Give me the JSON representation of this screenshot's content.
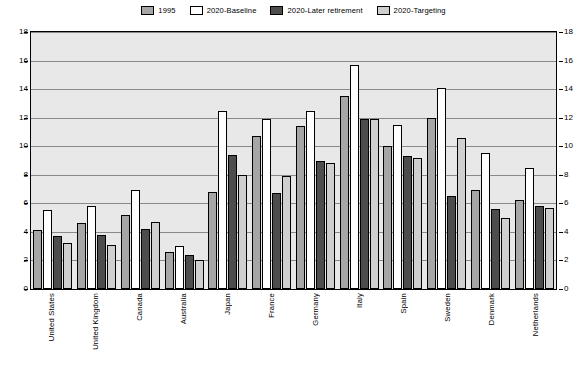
{
  "chart_data": {
    "type": "bar",
    "title": "",
    "subtitle": "",
    "xlabel": "",
    "ylabel": "",
    "ylim": [
      0,
      18
    ],
    "ytick_step": 2,
    "yticks": [
      "0",
      "2",
      "4",
      "6",
      "8",
      "10",
      "12",
      "14",
      "16",
      "18"
    ],
    "grid": true,
    "dual_y_axis": true,
    "legend_position": "top-center",
    "categories": [
      "United States",
      "United Kingdom",
      "Canada",
      "Australia",
      "Japan",
      "France",
      "Germany",
      "Italy",
      "Spain",
      "Sweden",
      "Denmark",
      "Netherlands"
    ],
    "series": [
      {
        "name": "1995",
        "color": "#a6a6a6",
        "values": [
          4.1,
          4.6,
          5.2,
          2.6,
          6.8,
          10.7,
          11.4,
          13.5,
          10.0,
          12.0,
          6.9,
          6.2
        ]
      },
      {
        "name": "2020-Baseline",
        "color": "#ffffff",
        "values": [
          5.5,
          5.8,
          6.9,
          3.0,
          12.5,
          11.9,
          12.5,
          15.7,
          11.5,
          14.1,
          9.5,
          8.5
        ]
      },
      {
        "name": "2020-Later retirement",
        "color": "#4d4d4d",
        "values": [
          3.7,
          3.8,
          4.2,
          2.4,
          9.4,
          6.7,
          9.0,
          11.9,
          9.3,
          6.5,
          5.6,
          5.8
        ]
      },
      {
        "name": "2020-Targeting",
        "color": "#cfcfcf",
        "values": [
          3.2,
          3.1,
          4.7,
          2.0,
          8.0,
          7.9,
          8.8,
          11.9,
          9.2,
          10.6,
          5.0,
          5.7
        ]
      }
    ]
  },
  "legend": {
    "items": [
      {
        "label": "1995",
        "color": "#a6a6a6"
      },
      {
        "label": "2020-Baseline",
        "color": "#ffffff"
      },
      {
        "label": "2020-Later retirement",
        "color": "#4d4d4d"
      },
      {
        "label": "2020-Targeting",
        "color": "#cfcfcf"
      }
    ]
  }
}
